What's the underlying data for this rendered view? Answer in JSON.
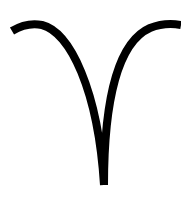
{
  "symbol": {
    "name": "Aries",
    "glyph": "♈",
    "icon": "aries-icon",
    "stroke_color": "#000000",
    "background_color": "#ffffff"
  }
}
